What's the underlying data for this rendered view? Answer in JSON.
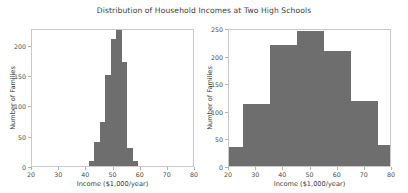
{
  "chart_data": [
    {
      "type": "bar",
      "subplot": "left",
      "title": "Distribution of Household Incomes at Two High Schools",
      "xlabel": "Income ($1,000/year)",
      "ylabel": "Number of Families",
      "xlim": [
        20,
        80
      ],
      "ylim": [
        0,
        228
      ],
      "xticks": [
        20,
        30,
        40,
        50,
        60,
        70,
        80
      ],
      "xticklabels": [
        "20",
        "30",
        "40",
        "50",
        "60",
        "70",
        "80"
      ],
      "yticks": [
        0,
        50,
        100,
        150,
        200
      ],
      "yticklabels": [
        "0",
        "50",
        "100",
        "150",
        "200"
      ],
      "grid": false,
      "legend": null,
      "bin_edges": [
        41,
        43,
        45,
        47,
        49,
        51,
        53,
        55,
        57,
        59
      ],
      "categories": [
        "41-43",
        "43-45",
        "45-47",
        "47-49",
        "49-51",
        "51-53",
        "53-55",
        "55-57",
        "57-59"
      ],
      "values": [
        9,
        40,
        73,
        150,
        210,
        228,
        172,
        30,
        9
      ],
      "bar_color": "#6e6e6e"
    },
    {
      "type": "bar",
      "subplot": "right",
      "title": "Distribution of Household Incomes at Two High Schools",
      "xlabel": "Income ($1,000/year)",
      "ylabel": "Number of Families",
      "xlim": [
        20,
        80
      ],
      "ylim": [
        0,
        250
      ],
      "xticks": [
        20,
        30,
        40,
        50,
        60,
        70,
        80
      ],
      "xticklabels": [
        "20",
        "30",
        "40",
        "50",
        "60",
        "70",
        "80"
      ],
      "yticks": [
        0,
        50,
        100,
        150,
        200,
        250
      ],
      "yticklabels": [
        "0",
        "50",
        "100",
        "150",
        "200",
        "250"
      ],
      "grid": false,
      "legend": null,
      "bin_edges": [
        20,
        25,
        35,
        45,
        55,
        65,
        75,
        80
      ],
      "categories": [
        "20-25",
        "25-35",
        "35-45",
        "45-55",
        "55-65",
        "65-75",
        "75-80"
      ],
      "values": [
        35,
        112,
        220,
        245,
        208,
        117,
        38
      ],
      "bar_color": "#6e6e6e"
    }
  ],
  "figure": {
    "title": "Distribution of Household Incomes at Two High Schools",
    "background": "#ffffff",
    "spine_color": "#c9c9c9"
  }
}
